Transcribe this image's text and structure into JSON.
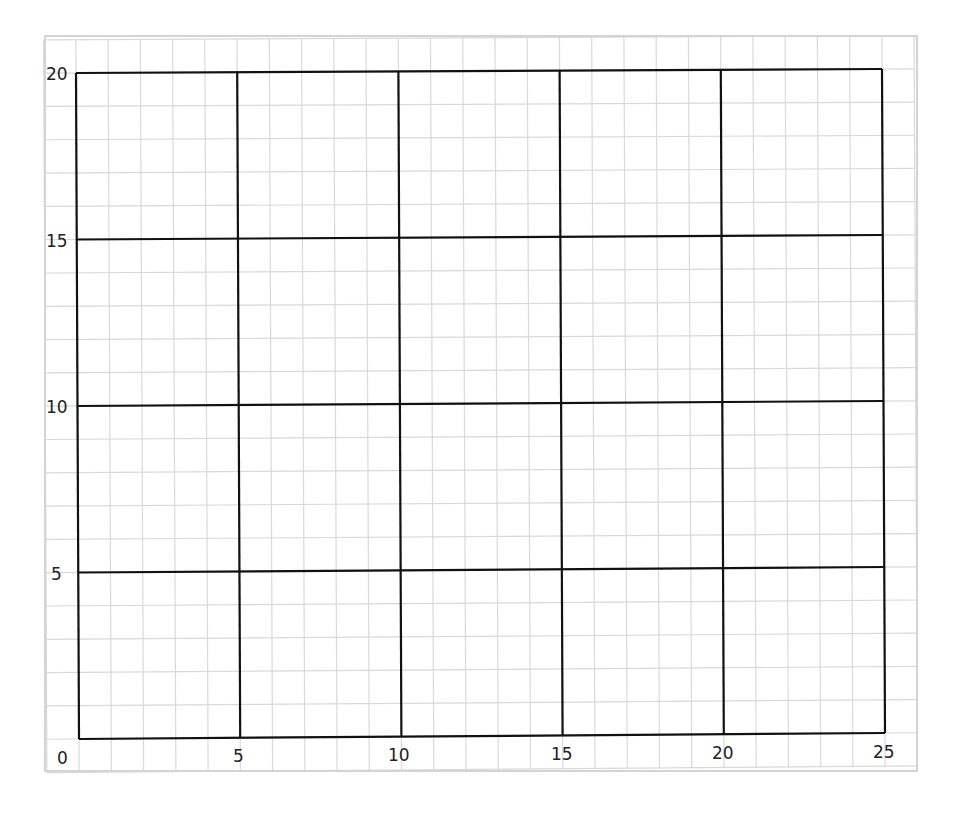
{
  "chart_data": {
    "type": "line",
    "title": "",
    "xlabel": "",
    "ylabel": "",
    "xlim": [
      0,
      25
    ],
    "ylim": [
      0,
      20
    ],
    "x_ticks": [
      0,
      5,
      10,
      15,
      20,
      25
    ],
    "y_ticks": [
      5,
      10,
      15,
      20
    ],
    "x_tick_labels": [
      "0",
      "5",
      "10",
      "15",
      "20",
      "25"
    ],
    "y_tick_labels": [
      "5",
      "10",
      "15",
      "20"
    ],
    "major_grid_step": 5,
    "minor_grid_step": 1,
    "grid": true,
    "series": [],
    "legend": null
  },
  "colors": {
    "major_grid": "#111111",
    "minor_grid": "#d9d9d9",
    "background": "#ffffff",
    "text": "#222222"
  },
  "labels": {
    "origin": "0",
    "x5": "5",
    "x10": "10",
    "x15": "15",
    "x20": "20",
    "x25": "25",
    "y5": "5",
    "y10": "10",
    "y15": "15",
    "y20": "20"
  }
}
